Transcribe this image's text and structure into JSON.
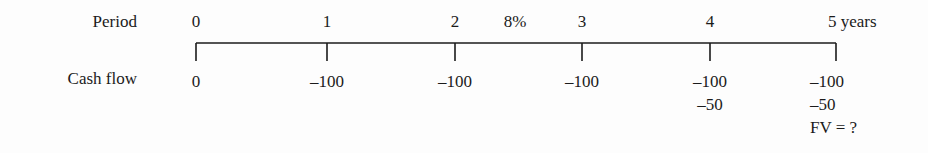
{
  "rows": {
    "period_label": "Period",
    "cashflow_label": "Cash flow"
  },
  "rate": {
    "label": "8%",
    "position_x": 515
  },
  "axis": {
    "line_y": 43,
    "tick_bottom_y": 61,
    "start_x": 196,
    "end_x": 836,
    "color": "#1b1b1b",
    "line_width": 1.6
  },
  "periods": [
    {
      "period_label": "0",
      "tick_x": 196,
      "cash_flows": [
        "0"
      ],
      "note": null,
      "align": "center"
    },
    {
      "period_label": "1",
      "tick_x": 327,
      "cash_flows": [
        "–100"
      ],
      "note": null,
      "align": "center"
    },
    {
      "period_label": "2",
      "tick_x": 455,
      "cash_flows": [
        "–100"
      ],
      "note": null,
      "align": "center"
    },
    {
      "period_label": "3",
      "tick_x": 582,
      "cash_flows": [
        "–100"
      ],
      "note": null,
      "align": "center"
    },
    {
      "period_label": "4",
      "tick_x": 710,
      "cash_flows": [
        "–100",
        "–50"
      ],
      "note": null,
      "align": "center"
    },
    {
      "period_label": "5 years",
      "tick_x": 836,
      "cash_flows": [
        "–100",
        "–50"
      ],
      "note": "FV = ?",
      "align": "end"
    }
  ],
  "chart_data": {
    "type": "table",
    "title": "",
    "xlabel": "Period",
    "ylabel": "Cash flow",
    "categories": [
      "0",
      "1",
      "2",
      "3",
      "4",
      "5 years"
    ],
    "series": [
      {
        "name": "Cash flow (primary)",
        "values": [
          0,
          -100,
          -100,
          -100,
          -100,
          -100
        ]
      },
      {
        "name": "Cash flow (additional)",
        "values": [
          null,
          null,
          null,
          null,
          -50,
          -50
        ]
      }
    ],
    "annotations": [
      {
        "text": "8%",
        "between_periods": [
          2,
          3
        ],
        "meaning": "interest rate"
      },
      {
        "text": "FV = ?",
        "at_period": "5 years",
        "meaning": "future value unknown"
      }
    ],
    "grid": false,
    "legend": "none"
  }
}
